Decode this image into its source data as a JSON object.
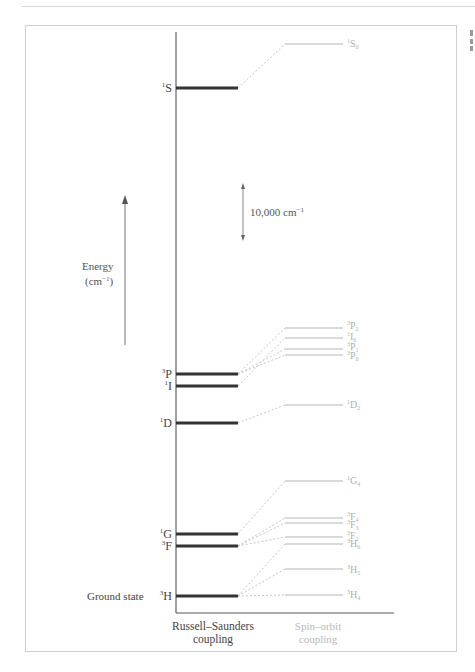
{
  "figure": {
    "axis_label": {
      "line1": "Energy",
      "line2": "(cm",
      "line2_sup": "−1",
      "line2_end": ")"
    },
    "scale_bar": {
      "label": "10,000 cm",
      "sup": "−1"
    },
    "ground_state_label": "Ground state",
    "column_labels": {
      "rs": {
        "line1": "Russell–Saunders",
        "line2": "coupling"
      },
      "so": {
        "line1": "Spin–orbit",
        "line2": "coupling"
      }
    },
    "colors": {
      "rs_level": "#333333",
      "so_level": "#b5b5b5",
      "connector": "#c8c8c8",
      "axis": "#444444"
    }
  },
  "chart_data": {
    "type": "energy-level-diagram",
    "title": "",
    "xlabel": "",
    "ylabel": "Energy (cm⁻¹)",
    "scale_bar": "10,000 cm⁻¹",
    "columns": [
      "Russell–Saunders coupling",
      "Spin–orbit coupling"
    ],
    "rs_terms": [
      {
        "mult": "1",
        "L": "S",
        "y": 88
      },
      {
        "mult": "3",
        "L": "P",
        "y": 374
      },
      {
        "mult": "1",
        "L": "I",
        "y": 386
      },
      {
        "mult": "1",
        "L": "D",
        "y": 423
      },
      {
        "mult": "1",
        "L": "G",
        "y": 534
      },
      {
        "mult": "3",
        "L": "F",
        "y": 546
      },
      {
        "mult": "3",
        "L": "H",
        "y": 596,
        "note": "Ground state"
      }
    ],
    "so_levels": [
      {
        "mult": "1",
        "L": "S",
        "J": "0",
        "y": 44,
        "from": "1S"
      },
      {
        "mult": "3",
        "L": "P",
        "J": "2",
        "y": 328,
        "from": "3P"
      },
      {
        "mult": "1",
        "L": "I",
        "J": "6",
        "y": 338,
        "from": "1I"
      },
      {
        "mult": "3",
        "L": "P",
        "J": "1",
        "y": 349,
        "from": "3P"
      },
      {
        "mult": "3",
        "L": "P",
        "J": "0",
        "y": 355,
        "from": "3P"
      },
      {
        "mult": "1",
        "L": "D",
        "J": "2",
        "y": 405,
        "from": "1D"
      },
      {
        "mult": "1",
        "L": "G",
        "J": "4",
        "y": 481,
        "from": "1G"
      },
      {
        "mult": "3",
        "L": "F",
        "J": "4",
        "y": 518,
        "from": "3F"
      },
      {
        "mult": "3",
        "L": "F",
        "J": "3",
        "y": 523,
        "from": "3F"
      },
      {
        "mult": "3",
        "L": "F",
        "J": "2",
        "y": 537,
        "from": "3F"
      },
      {
        "mult": "3",
        "L": "H",
        "J": "6",
        "y": 544,
        "from": "3H"
      },
      {
        "mult": "3",
        "L": "H",
        "J": "5",
        "y": 569,
        "from": "3H"
      },
      {
        "mult": "3",
        "L": "H",
        "J": "4",
        "y": 595,
        "from": "3H"
      }
    ]
  }
}
